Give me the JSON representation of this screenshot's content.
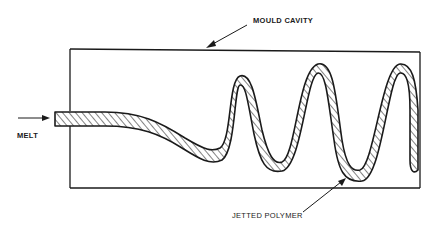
{
  "diagram": {
    "labels": {
      "mould_cavity": "MOULD CAVITY",
      "melt": "MELT",
      "jetted_polymer": "JETTED POLYMER"
    },
    "colors": {
      "line": "#1a1a1a",
      "fill": "#ffffff",
      "hatch": "#1a1a1a"
    }
  }
}
